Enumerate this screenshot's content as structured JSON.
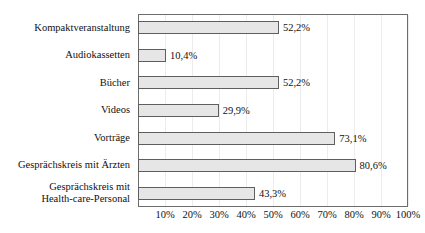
{
  "chart_data": {
    "type": "bar",
    "orientation": "horizontal",
    "title": "",
    "subtitle": "",
    "xlabel": "",
    "ylabel": "",
    "xlim": [
      0,
      100
    ],
    "grid": true,
    "legend": null,
    "value_suffix": "%",
    "decimal_separator": ",",
    "categories": [
      "Kompaktveranstaltung",
      "Audiokassetten",
      "Bücher",
      "Videos",
      "Vorträge",
      "Gesprächskreis mit Ärzten",
      "Gesprächskreis mit Health-care-Personal"
    ],
    "category_lines": [
      [
        "Kompaktveranstaltung"
      ],
      [
        "Audiokassetten"
      ],
      [
        "Bücher"
      ],
      [
        "Videos"
      ],
      [
        "Vorträge"
      ],
      [
        "Gesprächskreis mit Ärzten"
      ],
      [
        "Gesprächskreis mit",
        "Health-care-Personal"
      ]
    ],
    "values": [
      52.2,
      10.4,
      52.2,
      29.9,
      73.1,
      80.6,
      43.3
    ],
    "value_labels": [
      "52,2%",
      "10,4%",
      "52,2%",
      "29,9%",
      "73,1%",
      "80,6%",
      "43,3%"
    ],
    "xticks": [
      10,
      20,
      30,
      40,
      50,
      60,
      70,
      80,
      90,
      100
    ],
    "xtick_labels": [
      "10%",
      "20%",
      "30%",
      "40%",
      "50%",
      "60%",
      "70%",
      "80%",
      "90%",
      "100%"
    ],
    "colors": {
      "bar_fill": "#e6e6e6",
      "bar_border": "#5e5e5e",
      "frame": "#6c6c6c",
      "gridline": "#ececec",
      "text": "#111111",
      "background": "#ffffff"
    }
  }
}
